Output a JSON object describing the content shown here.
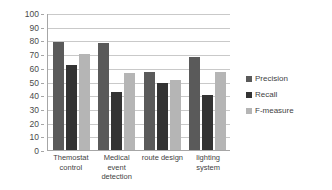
{
  "chart_data": {
    "type": "bar",
    "title": "",
    "xlabel": "",
    "ylabel": "",
    "ylim": [
      0,
      100
    ],
    "ytick_step": 10,
    "grid": true,
    "legend_position": "right",
    "categories": [
      "Themostat control",
      "Medical event detection",
      "route design",
      "lighting system"
    ],
    "ytick_labels": [
      "100",
      "90",
      "80",
      "70",
      "60",
      "50",
      "40",
      "30",
      "20",
      "10",
      "0"
    ],
    "series": [
      {
        "name": "Precision",
        "color": "#5a5a5a",
        "values": [
          79,
          78,
          57,
          68
        ]
      },
      {
        "name": "Recall",
        "color": "#333333",
        "values": [
          62,
          42,
          49,
          40
        ]
      },
      {
        "name": "F-measure",
        "color": "#b5b5b5",
        "values": [
          70,
          56,
          51,
          57
        ]
      }
    ]
  }
}
